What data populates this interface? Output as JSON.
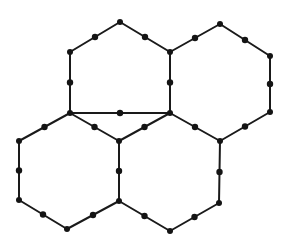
{
  "diagram": {
    "colors": {
      "line": "#1a1a1a",
      "node": "#141414",
      "background": "#ffffff"
    },
    "vertices": [
      {
        "id": "v1",
        "x": 120,
        "y": 22
      },
      {
        "id": "v2",
        "x": 70,
        "y": 52
      },
      {
        "id": "v3",
        "x": 170,
        "y": 52
      },
      {
        "id": "v4",
        "x": 220,
        "y": 24
      },
      {
        "id": "v5",
        "x": 270,
        "y": 56
      },
      {
        "id": "v6",
        "x": 70,
        "y": 113
      },
      {
        "id": "v7",
        "x": 170,
        "y": 113
      },
      {
        "id": "v8",
        "x": 270,
        "y": 112
      },
      {
        "id": "v9",
        "x": 19,
        "y": 141
      },
      {
        "id": "v10",
        "x": 119,
        "y": 141
      },
      {
        "id": "v11",
        "x": 220,
        "y": 141
      },
      {
        "id": "v12",
        "x": 19,
        "y": 200
      },
      {
        "id": "v13",
        "x": 119,
        "y": 201
      },
      {
        "id": "v14",
        "x": 219,
        "y": 203
      },
      {
        "id": "v15",
        "x": 67,
        "y": 229
      },
      {
        "id": "v16",
        "x": 170,
        "y": 231
      }
    ],
    "edges": [
      [
        "v1",
        "v2"
      ],
      [
        "v1",
        "v3"
      ],
      [
        "v2",
        "v6"
      ],
      [
        "v3",
        "v7"
      ],
      [
        "v3",
        "v4"
      ],
      [
        "v4",
        "v5"
      ],
      [
        "v5",
        "v8"
      ],
      [
        "v8",
        "v11"
      ],
      [
        "v6",
        "v7"
      ],
      [
        "v6",
        "v9"
      ],
      [
        "v6",
        "v10"
      ],
      [
        "v9",
        "v12"
      ],
      [
        "v12",
        "v15"
      ],
      [
        "v15",
        "v13"
      ],
      [
        "v10",
        "v13"
      ],
      [
        "v7",
        "v10"
      ],
      [
        "v7",
        "v11"
      ],
      [
        "v11",
        "v14"
      ],
      [
        "v14",
        "v16"
      ],
      [
        "v16",
        "v13"
      ]
    ],
    "hexagons": [
      {
        "name": "top-left",
        "vertices": [
          "v1",
          "v3",
          "v7",
          "v6",
          "v2"
        ]
      },
      {
        "name": "top-right",
        "vertices": [
          "v4",
          "v5",
          "v8",
          "v11",
          "v7",
          "v3"
        ]
      },
      {
        "name": "bottom-left",
        "vertices": [
          "v6",
          "v10",
          "v13",
          "v15",
          "v12",
          "v9"
        ]
      },
      {
        "name": "bottom-right",
        "vertices": [
          "v7",
          "v11",
          "v14",
          "v16",
          "v13",
          "v10"
        ]
      }
    ],
    "vertex_radius": 3,
    "midpoint_radius": 3.2,
    "line_width": 2
  }
}
